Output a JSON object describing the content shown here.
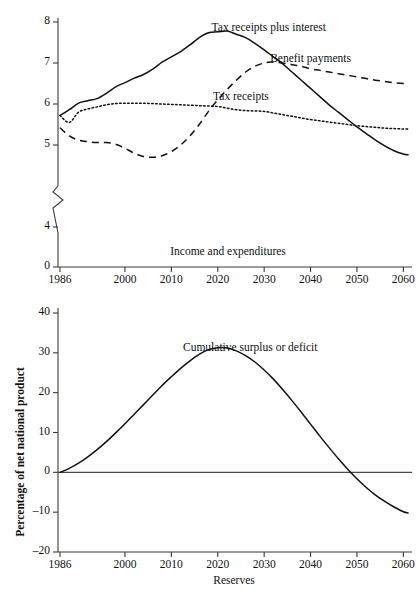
{
  "figure": {
    "ylabel": "Percentage of net national product"
  },
  "chart_data": [
    {
      "type": "line",
      "title": "Income and expenditures",
      "xlabel": "",
      "ylabel": "Percentage of net national product",
      "xlim": [
        1986,
        2061
      ],
      "ylim": [
        3.85,
        8.15
      ],
      "yticks": [
        "0",
        "4",
        "5",
        "6",
        "7",
        "8"
      ],
      "ytick_values": [
        0,
        4,
        5,
        6,
        7,
        8
      ],
      "y_axis_break": true,
      "y_axis_break_between": [
        0,
        4
      ],
      "xticks": [
        "1986",
        "2000",
        "2010",
        "2020",
        "2030",
        "2040",
        "2050",
        "2060"
      ],
      "xtick_values": [
        1986,
        2000,
        2010,
        2020,
        2030,
        2040,
        2050,
        2060
      ],
      "grid": false,
      "legend_position": "inline-annotations",
      "series": [
        {
          "name": "Tax receipts plus interest",
          "style": "solid",
          "label_x": 2031,
          "label_y": 7.82,
          "x": [
            1986,
            1988,
            1990,
            1992,
            1994,
            1996,
            1998,
            2000,
            2002,
            2004,
            2006,
            2008,
            2010,
            2012,
            2014,
            2016,
            2018,
            2020,
            2022,
            2024,
            2026,
            2028,
            2030,
            2032,
            2034,
            2036,
            2038,
            2040,
            2042,
            2044,
            2046,
            2048,
            2050,
            2052,
            2054,
            2056,
            2058,
            2060,
            2061
          ],
          "y": [
            5.72,
            5.86,
            6.02,
            6.08,
            6.13,
            6.26,
            6.42,
            6.52,
            6.63,
            6.72,
            6.85,
            7.02,
            7.15,
            7.28,
            7.44,
            7.62,
            7.74,
            7.76,
            7.78,
            7.7,
            7.62,
            7.48,
            7.32,
            7.15,
            6.98,
            6.78,
            6.58,
            6.38,
            6.18,
            5.98,
            5.8,
            5.62,
            5.44,
            5.28,
            5.12,
            4.98,
            4.86,
            4.78,
            4.76
          ]
        },
        {
          "name": "Benefit payments",
          "style": "dashed",
          "label_x": 2040,
          "label_y": 7.08,
          "x": [
            1986,
            1988,
            1990,
            1992,
            1994,
            1996,
            1998,
            2000,
            2002,
            2004,
            2006,
            2008,
            2010,
            2012,
            2014,
            2016,
            2018,
            2020,
            2022,
            2024,
            2026,
            2028,
            2030,
            2031,
            2032,
            2034,
            2036,
            2038,
            2040,
            2042,
            2044,
            2046,
            2048,
            2050,
            2052,
            2054,
            2056,
            2058,
            2060,
            2061
          ],
          "y": [
            5.42,
            5.22,
            5.12,
            5.08,
            5.06,
            5.06,
            5.02,
            4.92,
            4.8,
            4.72,
            4.7,
            4.74,
            4.84,
            5.0,
            5.22,
            5.5,
            5.82,
            6.1,
            6.35,
            6.58,
            6.78,
            6.92,
            7.0,
            7.02,
            7.02,
            7.0,
            6.96,
            6.92,
            6.86,
            6.82,
            6.78,
            6.74,
            6.7,
            6.66,
            6.62,
            6.58,
            6.55,
            6.52,
            6.5,
            6.5
          ]
        },
        {
          "name": "Tax receipts",
          "style": "dotted",
          "label_x": 2025,
          "label_y": 6.14,
          "x": [
            1986,
            1988,
            1990,
            1992,
            1994,
            1996,
            1998,
            2000,
            2002,
            2004,
            2006,
            2008,
            2010,
            2012,
            2014,
            2016,
            2018,
            2020,
            2022,
            2024,
            2026,
            2028,
            2030,
            2032,
            2034,
            2036,
            2038,
            2040,
            2042,
            2044,
            2046,
            2048,
            2050,
            2052,
            2054,
            2056,
            2058,
            2060,
            2061
          ],
          "y": [
            5.72,
            5.55,
            5.8,
            5.88,
            5.93,
            5.98,
            6.01,
            6.02,
            6.02,
            6.02,
            6.01,
            6.0,
            5.99,
            5.98,
            5.97,
            5.96,
            5.95,
            5.94,
            5.9,
            5.86,
            5.84,
            5.83,
            5.82,
            5.78,
            5.74,
            5.7,
            5.66,
            5.62,
            5.59,
            5.56,
            5.53,
            5.5,
            5.47,
            5.45,
            5.43,
            5.41,
            5.4,
            5.39,
            5.39
          ]
        }
      ]
    },
    {
      "type": "line",
      "title": "Reserves",
      "xlabel": "Reserves",
      "ylabel": "Percentage of net national product",
      "xlim": [
        1986,
        2061
      ],
      "ylim": [
        -20,
        40
      ],
      "yticks": [
        "40",
        "30",
        "20",
        "10",
        "0",
        "–10",
        "–20"
      ],
      "ytick_values": [
        40,
        30,
        20,
        10,
        0,
        -10,
        -20
      ],
      "xticks": [
        "1986",
        "2000",
        "2010",
        "2020",
        "2030",
        "2040",
        "2050",
        "2060"
      ],
      "xtick_values": [
        1986,
        2000,
        2010,
        2020,
        2030,
        2040,
        2050,
        2060
      ],
      "grid": false,
      "zero_line": true,
      "legend_position": "inline-annotations",
      "series": [
        {
          "name": "Cumulative surplus or deficit",
          "style": "solid",
          "label_x": 2027,
          "label_y": 31.0,
          "x": [
            1986,
            1988,
            1990,
            1992,
            1994,
            1996,
            1998,
            2000,
            2002,
            2004,
            2006,
            2008,
            2010,
            2012,
            2014,
            2016,
            2018,
            2020,
            2022,
            2024,
            2026,
            2028,
            2030,
            2032,
            2034,
            2036,
            2038,
            2040,
            2042,
            2044,
            2046,
            2048,
            2050,
            2052,
            2054,
            2056,
            2058,
            2060,
            2061
          ],
          "y": [
            0.0,
            1.0,
            2.3,
            3.9,
            5.7,
            7.7,
            9.9,
            12.2,
            14.6,
            17.0,
            19.4,
            21.8,
            24.0,
            26.1,
            28.0,
            29.6,
            30.8,
            31.3,
            31.2,
            30.5,
            29.3,
            27.7,
            25.7,
            23.4,
            20.8,
            18.0,
            15.1,
            12.1,
            9.1,
            6.2,
            3.4,
            0.8,
            -1.6,
            -3.8,
            -5.7,
            -7.3,
            -8.7,
            -9.9,
            -10.2
          ]
        }
      ]
    }
  ]
}
